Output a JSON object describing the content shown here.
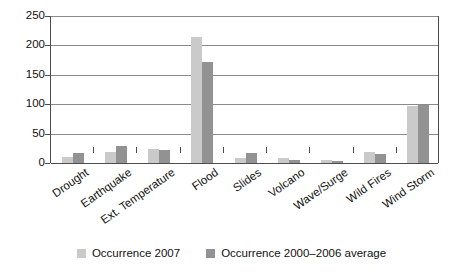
{
  "chart_data": {
    "type": "bar",
    "title": "",
    "subtitle": "",
    "xlabel": "",
    "ylabel": "",
    "ylim": [
      0,
      250
    ],
    "yticks": [
      0,
      50,
      100,
      150,
      200,
      250
    ],
    "ytick_labels": [
      "0",
      "50",
      "100",
      "150",
      "200",
      "250"
    ],
    "grid": true,
    "legend_position": "bottom-center",
    "categories": [
      "Drought",
      "Earthquake",
      "Ext. Temperature",
      "Flood",
      "Slides",
      "Volcano",
      "Wave/Surge",
      "Wild Fires",
      "Wind Storm"
    ],
    "series": [
      {
        "name": "Occurrence 2007",
        "color": "#cacaca",
        "values": [
          10,
          19,
          24,
          215,
          9,
          8,
          5,
          18,
          97
        ]
      },
      {
        "name": "Occurrence 2000–2006 average",
        "color": "#929292",
        "values": [
          17,
          29,
          22,
          172,
          17,
          5,
          3,
          16,
          99
        ]
      }
    ]
  },
  "axis_colors": {
    "axis_line": "#4d4d4d",
    "gridline": "#8a8a8a",
    "background": "#ffffff"
  }
}
